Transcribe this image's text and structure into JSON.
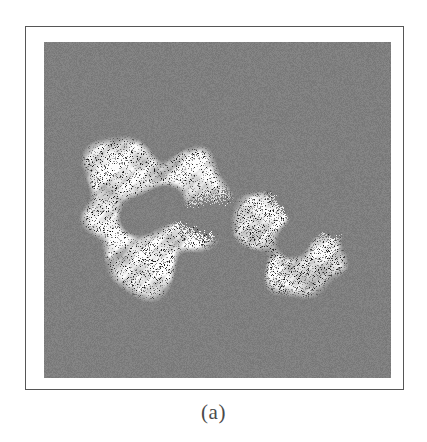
{
  "figure": {
    "caption": "(a)",
    "panel_label": "a",
    "modality": "CT",
    "frame": {
      "border_color": "#565656",
      "border_width_px": 1,
      "matte_color": "#ffffff",
      "x": 25,
      "y": 26,
      "width": 379,
      "height": 364
    },
    "image_panel": {
      "background_color": "#808080",
      "x": 43,
      "y": 41,
      "width": 347,
      "height": 336,
      "noise_amplitude": 9
    },
    "palette": {
      "background_gray": "#808080",
      "tissue_white": "#f8f8f6",
      "tissue_light_gray": "#c8c8c4",
      "tissue_mid_gray": "#9a9a98",
      "speckle_dark": "#2a2a2a",
      "speckle_black": "#0c0c0c",
      "caption_text": "#4a4a4a",
      "page_white": "#ffffff"
    }
  },
  "chart_data": {
    "type": "heatmap",
    "title": "(a)",
    "xlabel": "",
    "ylabel": "",
    "grid": false,
    "legend": "none",
    "colormap": "grayscale",
    "value_range": [
      0,
      255
    ],
    "regions": [
      {
        "name": "left-lung-field",
        "label": "left lung",
        "shape": "crescent",
        "center_x": 0.31,
        "center_y": 0.5,
        "radius_outer": 0.215,
        "radius_inner": 0.072,
        "opening_angle_deg": 22,
        "opening_direction_deg": 8,
        "mean_intensity": 232,
        "speckle_density": 0.3
      },
      {
        "name": "right-lung-field",
        "label": "right lung",
        "shape": "crescent",
        "center_x": 0.735,
        "center_y": 0.565,
        "radius_outer": 0.175,
        "radius_inner": 0.058,
        "opening_angle_deg": 120,
        "opening_direction_deg": 300,
        "mean_intensity": 224,
        "speckle_density": 0.42
      }
    ],
    "background_intensity": 128,
    "seed": 20240517
  }
}
